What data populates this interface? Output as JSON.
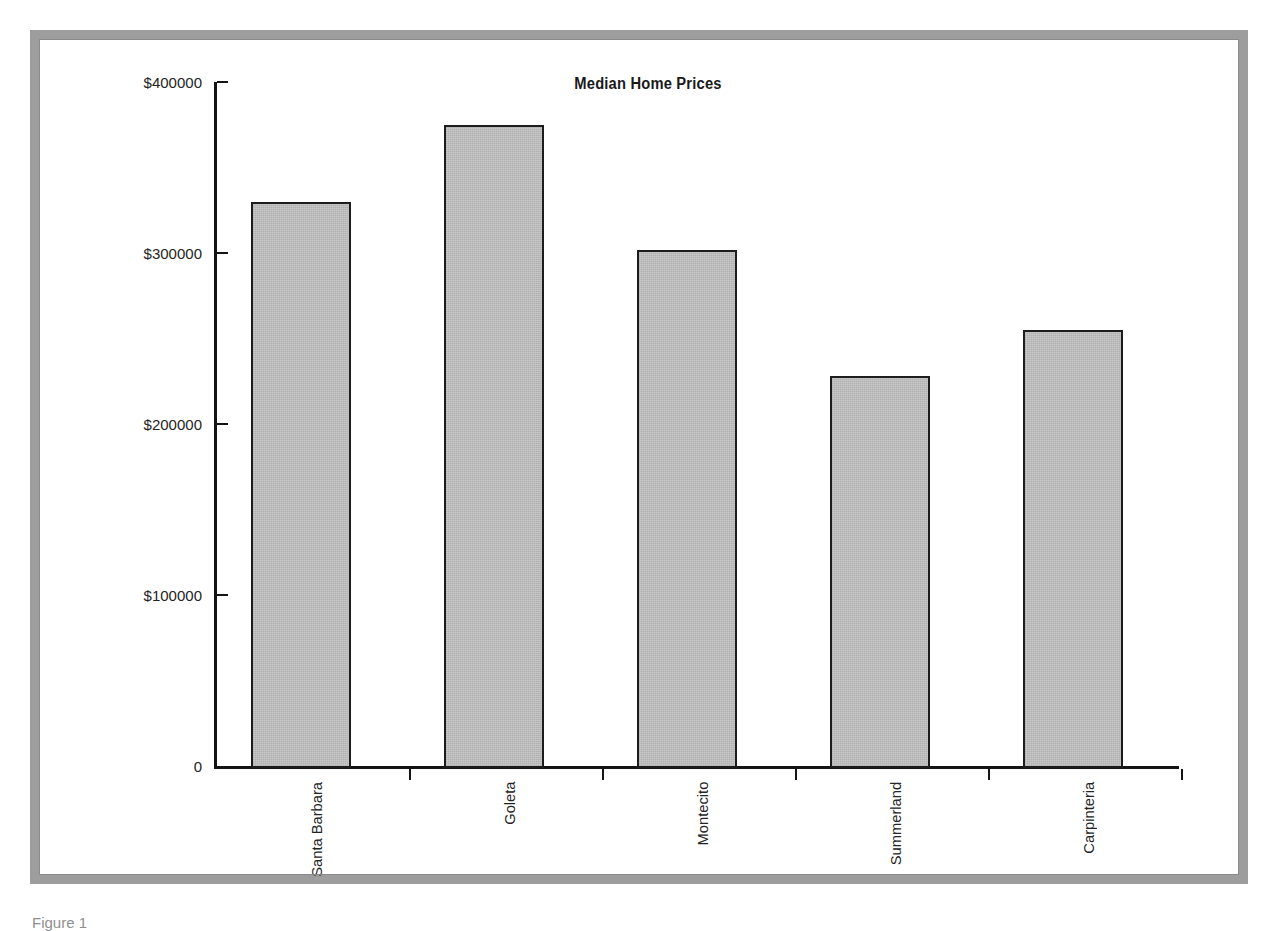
{
  "figure": {
    "caption": "Figure 1",
    "frame_color": "#9d9d9d",
    "background": "#ffffff"
  },
  "chart_data": {
    "type": "bar",
    "title": "Median Home Prices",
    "xlabel": "",
    "ylabel": "",
    "categories": [
      "Santa Barbara",
      "Goleta",
      "Montecito",
      "Summerland",
      "Carpinteria"
    ],
    "values": [
      330000,
      375000,
      302000,
      228000,
      255000
    ],
    "ylim": [
      0,
      400000
    ],
    "ytick_values": [
      0,
      100000,
      200000,
      300000,
      400000
    ],
    "ytick_labels": [
      "0",
      "$100000",
      "$200000",
      "$300000",
      "$400000"
    ],
    "grid": false,
    "legend": false,
    "bar_fill_color": "#c3c3c3",
    "bar_edge_color": "#1c1c1c",
    "axis_color": "#141414",
    "xtick_label_rotation": 90
  }
}
